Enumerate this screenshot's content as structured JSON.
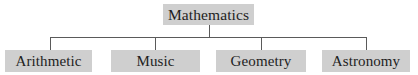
{
  "diagram": {
    "type": "tree",
    "root": {
      "label": "Mathematics"
    },
    "children": [
      {
        "label": "Arithmetic"
      },
      {
        "label": "Music"
      },
      {
        "label": "Geometry"
      },
      {
        "label": "Astronomy"
      }
    ],
    "colors": {
      "node_fill": "#cfcfcf",
      "node_text": "#1e1e1e",
      "connector": "#5a5a5a",
      "background": "#ffffff"
    }
  }
}
